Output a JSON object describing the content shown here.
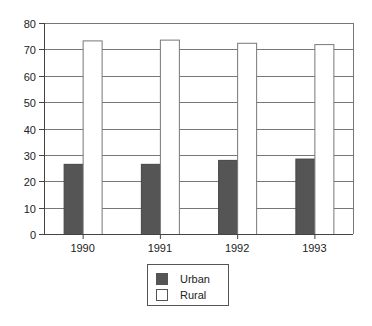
{
  "chart_data": {
    "type": "bar",
    "title": "",
    "xlabel": "",
    "ylabel": "",
    "categories": [
      "1990",
      "1991",
      "1992",
      "1993"
    ],
    "series": [
      {
        "name": "Urban",
        "values": [
          26.6,
          26.6,
          28.1,
          28.6
        ],
        "color": "#555555"
      },
      {
        "name": "Rural",
        "values": [
          73.4,
          73.7,
          72.5,
          72.0
        ],
        "color": "#ffffff"
      }
    ],
    "ylim": [
      0,
      80
    ],
    "yticks": [
      "0",
      "10",
      "20",
      "30",
      "40",
      "50",
      "60",
      "70",
      "80"
    ],
    "grid": true,
    "legend": "bottom-center"
  },
  "legend": {
    "items": [
      {
        "label": "Urban"
      },
      {
        "label": "Rural"
      }
    ]
  }
}
